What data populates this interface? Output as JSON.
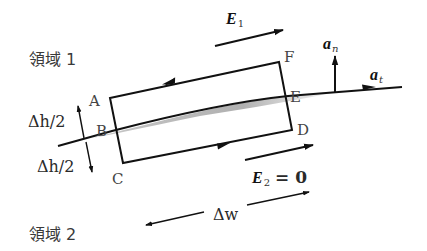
{
  "regions": {
    "region1": "領域 1",
    "region2": "領域 2"
  },
  "points": {
    "A": "A",
    "B": "B",
    "C": "C",
    "D": "D",
    "E": "E",
    "F": "F"
  },
  "vectors": {
    "E1": {
      "symbol": "E",
      "subscript": "1"
    },
    "E2": {
      "symbol": "E",
      "subscript": "2",
      "equals": "= 0"
    },
    "an": {
      "symbol": "a",
      "subscript": "n"
    },
    "at": {
      "symbol": "a",
      "subscript": "t"
    }
  },
  "dimensions": {
    "dh_upper": "Δh/2",
    "dh_lower": "Δh/2",
    "dw": "Δw"
  },
  "colors": {
    "stroke": "#111111",
    "shade": "#b5b5b5",
    "text": "#2a2a2a"
  }
}
